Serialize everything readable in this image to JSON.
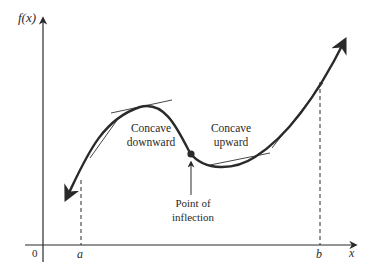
{
  "figure": {
    "type": "concavity-diagram",
    "y_axis_label": "f(x)",
    "x_axis_label": "x",
    "origin_label": "0",
    "a_label": "a",
    "b_label": "b",
    "annotations": {
      "concave_down_line1": "Concave",
      "concave_down_line2": "downward",
      "concave_up_line1": "Concave",
      "concave_up_line2": "upward",
      "inflection_line1": "Point of",
      "inflection_line2": "inflection"
    },
    "colors": {
      "curve": "#2a2a2a",
      "axes": "#2a2a2a",
      "tangent": "#333333",
      "background": "#ffffff"
    }
  }
}
